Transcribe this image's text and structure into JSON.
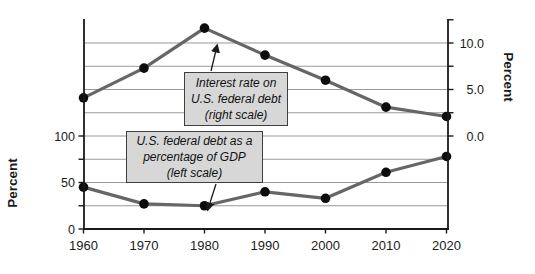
{
  "figure": {
    "width": 535,
    "height": 274,
    "background": "#ffffff"
  },
  "colors": {
    "axis": "#1a1a1a",
    "grid": "#999999",
    "series_line": "#666666",
    "marker": "#0d0d0d",
    "callout_fill": "#d7d7d7",
    "callout_border": "#3f3f3f",
    "text": "#1a1a1a"
  },
  "chart_data": {
    "type": "line",
    "title": "",
    "x": [
      1960,
      1970,
      1980,
      1990,
      2000,
      2010,
      2020
    ],
    "x_tick_labels": [
      "1960",
      "1970",
      "1980",
      "1990",
      "2000",
      "2010",
      "2020"
    ],
    "series": [
      {
        "name": "Interest rate on U.S. federal debt",
        "axis": "right",
        "values": [
          4.1,
          7.3,
          11.6,
          8.7,
          6.0,
          3.1,
          2.1
        ]
      },
      {
        "name": "U.S. federal debt as a percentage of GDP",
        "axis": "left",
        "values": [
          45,
          27,
          25,
          40,
          33,
          61,
          78
        ]
      }
    ],
    "left_axis": {
      "title": "Percent",
      "tick_labels": [
        "0",
        "50",
        "100"
      ],
      "tick_values": [
        0,
        50,
        100
      ],
      "minor_tick_values": [
        0,
        25,
        50,
        75,
        100
      ],
      "range": [
        0,
        225
      ]
    },
    "right_axis": {
      "title": "Percent",
      "tick_labels": [
        "0.0",
        "5.0",
        "10.0"
      ],
      "tick_values": [
        0,
        5,
        10
      ],
      "minor_tick_values": [
        0,
        2.5,
        5,
        7.5,
        10,
        12.5
      ],
      "range": [
        0,
        12.5
      ],
      "zero_aligned_with_left_value": 100
    },
    "grid": {
      "show": true,
      "left_unit_values": [
        25,
        50,
        75,
        100,
        125,
        150,
        175,
        200
      ]
    },
    "annotations": [
      {
        "id": "interest-rate-callout",
        "lines": [
          "Interest rate on",
          "U.S. federal debt",
          "(right scale)"
        ],
        "box": {
          "x": 184,
          "y": 72,
          "w": 104,
          "h": 54
        },
        "arrow": {
          "x1": 211,
          "y1": 71,
          "x2": 217,
          "y2": 46
        }
      },
      {
        "id": "debt-gdp-callout",
        "lines": [
          "U.S. federal debt as a",
          "percentage of GDP",
          "(left scale)"
        ],
        "box": {
          "x": 126,
          "y": 131,
          "w": 137,
          "h": 52
        },
        "arrow": {
          "x1": 216,
          "y1": 184,
          "x2": 208,
          "y2": 209
        }
      }
    ]
  }
}
